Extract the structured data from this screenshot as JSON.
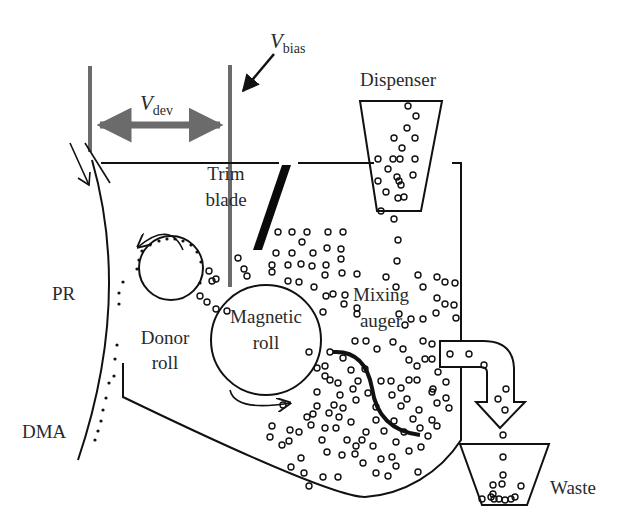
{
  "diagram": {
    "colors": {
      "line": "#1a1a1a",
      "bias_line": "#6b6b6b",
      "blade": "#0a0a0a",
      "background": "#ffffff"
    },
    "labels": {
      "v_bias": {
        "symbol": "V",
        "subscript": "bias"
      },
      "v_dev": {
        "symbol": "V",
        "subscript": "dev"
      },
      "dispenser": "Dispenser",
      "trim_blade_line1": "Trim",
      "trim_blade_line2": "blade",
      "pr": "PR",
      "donor_roll_line1": "Donor",
      "donor_roll_line2": "roll",
      "magnetic_roll_line1": "Magnetic",
      "magnetic_roll_line2": "roll",
      "mixing_auger_line1": "Mixing",
      "mixing_auger_line2": "auger",
      "dma": "DMA",
      "waste": "Waste"
    },
    "components": [
      {
        "id": "photoreceptor",
        "label": "PR"
      },
      {
        "id": "donor-roll",
        "label": "Donor roll"
      },
      {
        "id": "magnetic-roll",
        "label": "Magnetic roll"
      },
      {
        "id": "trim-blade",
        "label": "Trim blade"
      },
      {
        "id": "mixing-auger",
        "label": "Mixing auger"
      },
      {
        "id": "dispenser",
        "label": "Dispenser"
      },
      {
        "id": "waste-bin",
        "label": "Waste"
      },
      {
        "id": "dma",
        "label": "DMA"
      }
    ]
  }
}
